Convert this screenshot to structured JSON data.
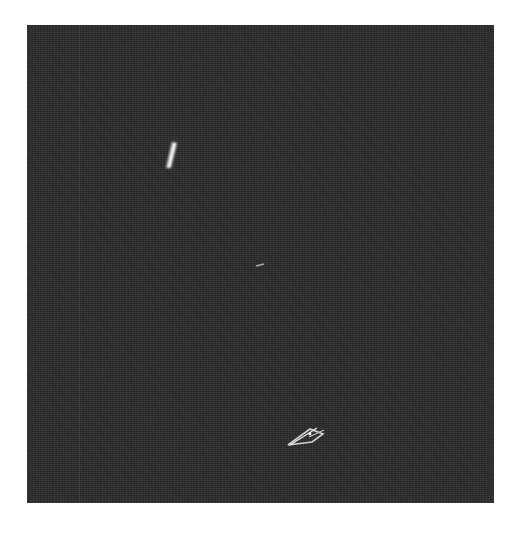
{
  "image": {
    "description": "Grayscale noisy dark frame with three bright streak features",
    "background_color": "#2b2b2b",
    "page_color": "#ffffff",
    "frame": {
      "x": 27,
      "y": 25,
      "width": 467,
      "height": 478
    }
  },
  "features": [
    {
      "name": "upper-left-streak",
      "shape": "elongated streak",
      "approx_center": [
        172,
        155
      ],
      "color": "#d8d8d8"
    },
    {
      "name": "center-faint-streak",
      "shape": "short faint dash",
      "approx_center": [
        260,
        265
      ],
      "color": "#9a9a9a"
    },
    {
      "name": "lower-arrow-streak",
      "shape": "arrow-like / X-shaped streak",
      "approx_center": [
        302,
        437
      ],
      "color": "#c8c8c8"
    }
  ]
}
